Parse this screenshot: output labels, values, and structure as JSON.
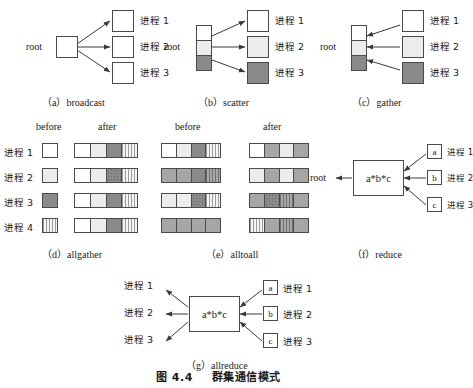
{
  "figure": {
    "caption_number": "图 4.4",
    "caption_title": "群集通信模式"
  },
  "panels": {
    "broadcast": {
      "caption": "（a）broadcast",
      "root_label": "root",
      "targets": [
        "进程 1",
        "进程 2",
        "进程 3"
      ]
    },
    "scatter": {
      "caption": "（b）scatter",
      "root_label": "root",
      "targets": [
        "进程 1",
        "进程 2",
        "进程 3"
      ],
      "root_cells": [
        "white",
        "light",
        "dark"
      ],
      "target_fills": [
        "white",
        "light",
        "dark"
      ]
    },
    "gather": {
      "caption": "（c）gather",
      "root_label": "root",
      "targets": [
        "进程 1",
        "进程 2",
        "进程 3"
      ],
      "root_cells": [
        "white",
        "light",
        "dark"
      ],
      "target_fills": [
        "white",
        "light",
        "dark"
      ]
    },
    "allgather": {
      "caption": "（d）allgather",
      "col_before": "before",
      "col_after": "after",
      "rows": [
        "进程 1",
        "进程 2",
        "进程 3",
        "进程 4"
      ],
      "before": [
        [
          "white"
        ],
        [
          "light"
        ],
        [
          "dark"
        ],
        [
          "stripe"
        ]
      ],
      "after": [
        [
          "white",
          "light",
          "dark",
          "stripe"
        ],
        [
          "white",
          "light",
          "dark",
          "stripe"
        ],
        [
          "white",
          "light",
          "dark",
          "stripe"
        ],
        [
          "white",
          "light",
          "dark",
          "stripe"
        ]
      ]
    },
    "alltoall": {
      "caption": "（e）alltoall",
      "col_before": "before",
      "col_after": "after",
      "before": [
        [
          "white",
          "light",
          "dark",
          "stripe"
        ],
        [
          "mid",
          "mid",
          "dark",
          "stripe-d"
        ],
        [
          "light",
          "light",
          "dot",
          "stripe"
        ],
        [
          "mid",
          "mid",
          "mid",
          "mid"
        ]
      ],
      "after": [
        [
          "white",
          "mid",
          "light",
          "mid"
        ],
        [
          "light",
          "mid",
          "light",
          "mid"
        ],
        [
          "mid",
          "dot",
          "stripe-d",
          "mid"
        ],
        [
          "stripe",
          "mid",
          "stripe-d",
          "mid"
        ]
      ]
    },
    "reduce": {
      "caption": "（f）reduce",
      "root_label": "root",
      "op_label": "a*b*c",
      "inputs": [
        {
          "value": "a",
          "process": "进程 1"
        },
        {
          "value": "b",
          "process": "进程 2"
        },
        {
          "value": "c",
          "process": "进程 3"
        }
      ]
    },
    "allreduce": {
      "caption": "（g）allreduce",
      "op_label": "a*b*c",
      "outputs": [
        "进程 1",
        "进程 2",
        "进程 3"
      ],
      "inputs": [
        {
          "value": "a",
          "process": "进程 1"
        },
        {
          "value": "b",
          "process": "进程 2"
        },
        {
          "value": "c",
          "process": "进程 3"
        }
      ]
    }
  },
  "colors": {
    "line": "#4a4a4a",
    "text": "#1a1a1a",
    "white": "#ffffff",
    "light": "#ececed",
    "mid": "#a6a6a6",
    "dark": "#8a8a8a"
  }
}
